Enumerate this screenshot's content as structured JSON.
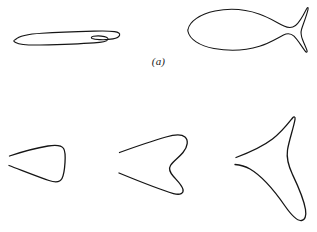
{
  "figure": {
    "background_color": "#ffffff",
    "stroke_color": "#151515",
    "width": 317,
    "height": 232,
    "panels": [
      {
        "id": "a",
        "label": "(a)",
        "shapes": [
          {
            "name": "thin-lens-curve",
            "description": "elongated thin closed lens-like curve with small cusp loop at right end",
            "closed": true,
            "stroke_width": 1.1
          },
          {
            "name": "fish-curve",
            "description": "closed fish-shaped curve with rounded body and forked swallowtail",
            "closed": true,
            "stroke_width": 1.1
          }
        ]
      },
      {
        "id": "b",
        "label": "(b)",
        "shapes": [
          {
            "name": "rounded-triangle-curve",
            "description": "open rounded triangular arrowhead curve, gap at left vertex",
            "closed": false,
            "stroke_width": 1.3
          },
          {
            "name": "chevron-wave-curve",
            "description": "open chevron curve with S-wave along right side, gap at left vertex",
            "closed": false,
            "stroke_width": 1.3
          },
          {
            "name": "three-point-star-curve",
            "description": "open concave three-pointed star / boomerang curve, gap at left vertex",
            "closed": false,
            "stroke_width": 1.3
          }
        ]
      }
    ]
  }
}
